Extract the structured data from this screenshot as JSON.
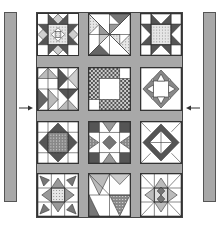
{
  "diagram": {
    "type": "quilt-layout",
    "colors": {
      "sashing": "#a8a8a8",
      "dark": "#555555",
      "medium": "#9a9a9a",
      "light": "#d4d4d4",
      "background": "#ffffff",
      "outline": "#333333"
    },
    "side_borders": [
      {
        "id": "left-border",
        "side": "left"
      },
      {
        "id": "right-border",
        "side": "right"
      }
    ],
    "arrows": [
      {
        "id": "left-arrow",
        "direction": "right"
      },
      {
        "id": "right-arrow",
        "direction": "left"
      }
    ],
    "grid": {
      "rows": 4,
      "columns": 3
    },
    "blocks": [
      {
        "row": 1,
        "col": 1,
        "pattern": "eight-point-star-with-center-square"
      },
      {
        "row": 1,
        "col": 2,
        "pattern": "pinwheel-triangles"
      },
      {
        "row": 1,
        "col": 3,
        "pattern": "sawtooth-star-dotted-center"
      },
      {
        "row": 2,
        "col": 1,
        "pattern": "flying-geese-pinwheel"
      },
      {
        "row": 2,
        "col": 2,
        "pattern": "checkerboard-frame"
      },
      {
        "row": 2,
        "col": 3,
        "pattern": "square-in-square-star"
      },
      {
        "row": 3,
        "col": 1,
        "pattern": "dotted-diamond-in-square"
      },
      {
        "row": 3,
        "col": 2,
        "pattern": "flying-geese-cross"
      },
      {
        "row": 3,
        "col": 3,
        "pattern": "diamond-in-square"
      },
      {
        "row": 4,
        "col": 1,
        "pattern": "star-of-stars"
      },
      {
        "row": 4,
        "col": 2,
        "pattern": "triangle-blocks"
      },
      {
        "row": 4,
        "col": 3,
        "pattern": "star-of-stars-light"
      }
    ]
  }
}
